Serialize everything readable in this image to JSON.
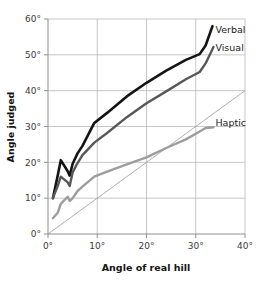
{
  "chart_data": {
    "type": "line",
    "title": "",
    "xlabel": "Angle of real hill",
    "ylabel": "Angle judged",
    "xlim": [
      0,
      40
    ],
    "ylim": [
      0,
      60
    ],
    "xticks": [
      "0°",
      "10°",
      "20°",
      "30°",
      "40°"
    ],
    "xtick_values": [
      0,
      10,
      20,
      30,
      40
    ],
    "yticks": [
      "0°",
      "10°",
      "20°",
      "30°",
      "40°",
      "50°",
      "60°"
    ],
    "ytick_values": [
      0,
      10,
      20,
      30,
      40,
      50,
      60
    ],
    "grid": true,
    "legend_position": "inline-right",
    "annotations": [
      {
        "name": "verbal-label",
        "text": "Verbal",
        "x": 34.0,
        "y": 57.0
      },
      {
        "name": "visual-label",
        "text": "Visual",
        "x": 34.0,
        "y": 52.0
      },
      {
        "name": "haptic-label",
        "text": "Haptic",
        "x": 34.0,
        "y": 31.0
      }
    ],
    "reference_line": {
      "name": "identity-line",
      "label": "veridical 1:1",
      "x": [
        0,
        40
      ],
      "y": [
        0,
        40
      ],
      "color": "#9a9a9a"
    },
    "series": [
      {
        "name": "Verbal",
        "color": "#141414",
        "width": 2.6,
        "x": [
          1.0,
          2.0,
          2.6,
          4.0,
          4.4,
          5.0,
          6.0,
          7.0,
          9.4,
          12.0,
          16.0,
          20.0,
          24.0,
          28.0,
          30.8,
          32.0,
          33.4
        ],
        "y": [
          10.0,
          16.5,
          20.6,
          17.5,
          16.3,
          19.6,
          22.5,
          24.6,
          31.0,
          33.8,
          38.4,
          42.2,
          45.6,
          48.6,
          50.2,
          52.6,
          58.0
        ]
      },
      {
        "name": "Visual",
        "color": "#585858",
        "width": 2.4,
        "x": [
          1.0,
          2.0,
          2.6,
          4.0,
          4.4,
          5.0,
          6.0,
          7.0,
          9.4,
          12.0,
          16.0,
          20.0,
          24.0,
          28.0,
          30.8,
          32.0,
          33.6
        ],
        "y": [
          10.0,
          13.5,
          16.0,
          14.4,
          13.4,
          17.2,
          19.8,
          22.0,
          25.5,
          28.2,
          32.6,
          36.5,
          39.8,
          43.2,
          45.2,
          47.6,
          52.2
        ]
      },
      {
        "name": "Haptic",
        "color": "#9d9d9d",
        "width": 2.4,
        "x": [
          1.0,
          2.0,
          2.6,
          4.0,
          4.4,
          5.0,
          6.0,
          7.0,
          9.4,
          12.0,
          16.0,
          20.0,
          24.0,
          28.0,
          30.8,
          32.0,
          33.6
        ],
        "y": [
          4.4,
          6.0,
          8.4,
          10.4,
          9.2,
          10.0,
          12.0,
          13.2,
          16.0,
          17.4,
          19.4,
          21.4,
          24.0,
          26.4,
          28.6,
          29.6,
          29.8
        ]
      }
    ]
  },
  "axes": {
    "x_title": "Angle of real hill",
    "y_title": "Angle judged"
  }
}
